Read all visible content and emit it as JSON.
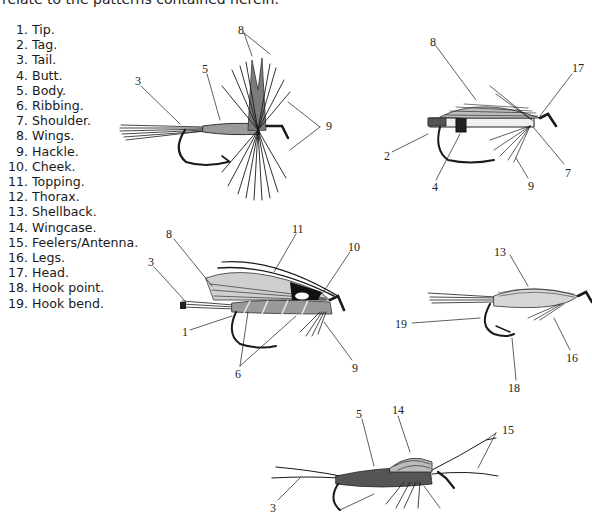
{
  "page": {
    "intro_text": "relate to the patterns contained herein."
  },
  "legend": {
    "items": [
      {
        "num": "1.",
        "term": "Tip."
      },
      {
        "num": "2.",
        "term": "Tag."
      },
      {
        "num": "3.",
        "term": "Tail."
      },
      {
        "num": "4.",
        "term": "Butt."
      },
      {
        "num": "5.",
        "term": "Body."
      },
      {
        "num": "6.",
        "term": "Ribbing."
      },
      {
        "num": "7.",
        "term": "Shoulder."
      },
      {
        "num": "8.",
        "term": "Wings."
      },
      {
        "num": "9.",
        "term": "Hackle."
      },
      {
        "num": "10.",
        "term": "Cheek."
      },
      {
        "num": "11.",
        "term": "Topping."
      },
      {
        "num": "12.",
        "term": "Thorax."
      },
      {
        "num": "13.",
        "term": "Shellback."
      },
      {
        "num": "14.",
        "term": "Wingcase."
      },
      {
        "num": "15.",
        "term": "Feelers/Antenna."
      },
      {
        "num": "16.",
        "term": "Legs."
      },
      {
        "num": "17.",
        "term": "Head."
      },
      {
        "num": "18.",
        "term": "Hook point."
      },
      {
        "num": "19.",
        "term": "Hook bend."
      }
    ]
  },
  "figures": {
    "dry_fly": {
      "callouts": [
        {
          "label": "8",
          "x": 238,
          "y": 24
        },
        {
          "label": "5",
          "x": 202,
          "y": 63
        },
        {
          "label": "3",
          "x": 135,
          "y": 75
        },
        {
          "label": "9",
          "x": 326,
          "y": 124
        }
      ]
    },
    "wet_fly": {
      "callouts": [
        {
          "label": "8",
          "x": 430,
          "y": 36
        },
        {
          "label": "17",
          "x": 574,
          "y": 63
        },
        {
          "label": "2",
          "x": 385,
          "y": 150
        },
        {
          "label": "4",
          "x": 432,
          "y": 182
        },
        {
          "label": "9",
          "x": 528,
          "y": 180
        },
        {
          "label": "7",
          "x": 565,
          "y": 167
        }
      ]
    },
    "streamer": {
      "callouts": [
        {
          "label": "8",
          "x": 167,
          "y": 228
        },
        {
          "label": "11",
          "x": 295,
          "y": 223
        },
        {
          "label": "10",
          "x": 351,
          "y": 241
        },
        {
          "label": "3",
          "x": 149,
          "y": 256
        },
        {
          "label": "1",
          "x": 183,
          "y": 331
        },
        {
          "label": "9",
          "x": 353,
          "y": 362
        },
        {
          "label": "6",
          "x": 236,
          "y": 368
        }
      ]
    },
    "nymph_shellback": {
      "callouts": [
        {
          "label": "13",
          "x": 497,
          "y": 246
        },
        {
          "label": "19",
          "x": 397,
          "y": 318
        },
        {
          "label": "16",
          "x": 571,
          "y": 353
        },
        {
          "label": "18",
          "x": 511,
          "y": 383
        }
      ]
    },
    "nymph_wingcase": {
      "callouts": [
        {
          "label": "5",
          "x": 357,
          "y": 410
        },
        {
          "label": "14",
          "x": 393,
          "y": 405
        },
        {
          "label": "15",
          "x": 502,
          "y": 427
        },
        {
          "label": "3",
          "x": 271,
          "y": 503
        }
      ]
    }
  }
}
